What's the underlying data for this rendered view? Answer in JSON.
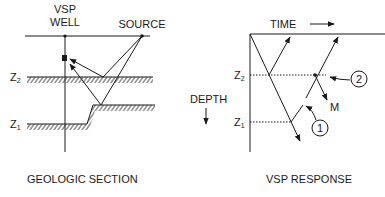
{
  "geologic_section": {
    "title": "GEOLOGIC SECTION",
    "well_label_line1": "VSP",
    "well_label_line2": "WELL",
    "source_label": "SOURCE",
    "z2_label": "Z",
    "z2_sub": "2",
    "z1_label": "Z",
    "z1_sub": "1"
  },
  "vsp_response": {
    "title": "VSP RESPONSE",
    "time_label": "TIME",
    "depth_label": "DEPTH",
    "z2_label": "Z",
    "z2_sub": "2",
    "z1_label": "Z",
    "z1_sub": "1",
    "callout_1": "1",
    "callout_2": "2",
    "multiple_label": "M"
  },
  "colors": {
    "ink": "#1a1a1a",
    "background": "#ffffff"
  }
}
